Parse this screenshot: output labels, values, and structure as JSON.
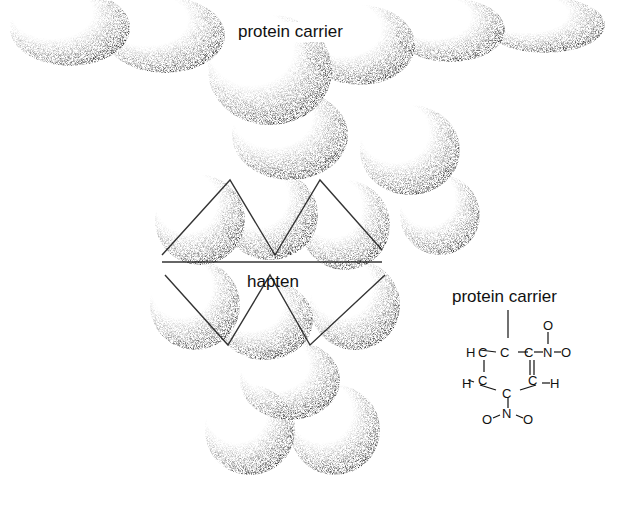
{
  "figure": {
    "model_labels": {
      "top": "protein carrier",
      "center": "hapten"
    },
    "formula": {
      "title": "protein carrier",
      "atoms": {
        "c1": "C",
        "c2": "C",
        "c3": "C",
        "c4": "C",
        "c5": "C",
        "c6": "C",
        "h1": "H",
        "h2": "H",
        "h3": "H",
        "n1": "N",
        "n2": "N",
        "o1": "O",
        "o2": "O",
        "o3": "O",
        "o4": "O"
      }
    },
    "colors": {
      "ink": "#111111",
      "background": "#ffffff"
    }
  }
}
